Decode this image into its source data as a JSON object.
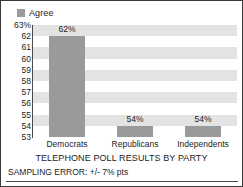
{
  "legend": {
    "position": "top-left",
    "entries": [
      {
        "label": "Agree",
        "color": "#9b9b9b",
        "marker": "square-swatch-icon"
      }
    ]
  },
  "chart_data": {
    "type": "bar",
    "title": "TELEPHONE POLL RESULTS BY PARTY",
    "xlabel": "",
    "ylabel": "",
    "categories": [
      "Democrats",
      "Republicans",
      "Independents"
    ],
    "series": [
      {
        "name": "Agree",
        "values": [
          62,
          54,
          54
        ],
        "data_labels": [
          "62%",
          "54%",
          "54%"
        ],
        "color": "#9a9a9a"
      }
    ],
    "ylim": [
      53,
      63
    ],
    "ytick_values": [
      63,
      62,
      61,
      60,
      59,
      58,
      57,
      56,
      55,
      54,
      53
    ],
    "ytick_labels": [
      "63%",
      "62",
      "61",
      "60",
      "59",
      "58",
      "57",
      "56",
      "55",
      "54",
      "53"
    ],
    "grid": "horizontal-alternating-bands",
    "band_colors": [
      "#e3e3e3",
      "#ffffff"
    ],
    "legend_position": "top-left"
  },
  "footer": {
    "sampling_error": "SAMPLING ERROR: +/- 7% pts"
  }
}
